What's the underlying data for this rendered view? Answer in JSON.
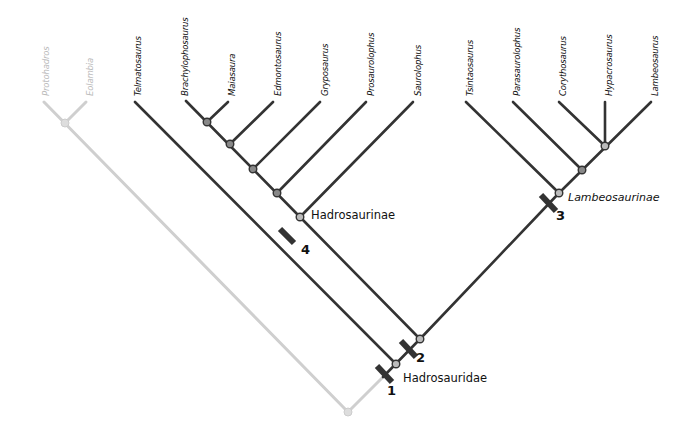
{
  "taxa": {
    "outgroup": [
      "Protohadros",
      "Eolambia"
    ],
    "telmatosaurus": "Telmatosaurus",
    "hadrosaurinae": [
      "Brachylophosaurus",
      "Maiasaura",
      "Edmontosaurus",
      "Gryposaurus",
      "Prosaurolophus",
      "Saurolophus"
    ],
    "lambeosaurinae": [
      "Tsintaosaurus",
      "Parasaurolophus",
      "Corythosaurus",
      "Hypacrosaurus",
      "Lambeosaurus"
    ]
  },
  "clades": {
    "hadrosauridae": "Hadrosauridae",
    "hadrosaurinae": "Hadrosaurinae",
    "lambeosaurinae": "Lambeosaurinae"
  },
  "markers": [
    "1",
    "2",
    "3",
    "4"
  ],
  "colors": {
    "branch": "#333333",
    "outgroup": "#cccccc",
    "node": "#555555"
  }
}
